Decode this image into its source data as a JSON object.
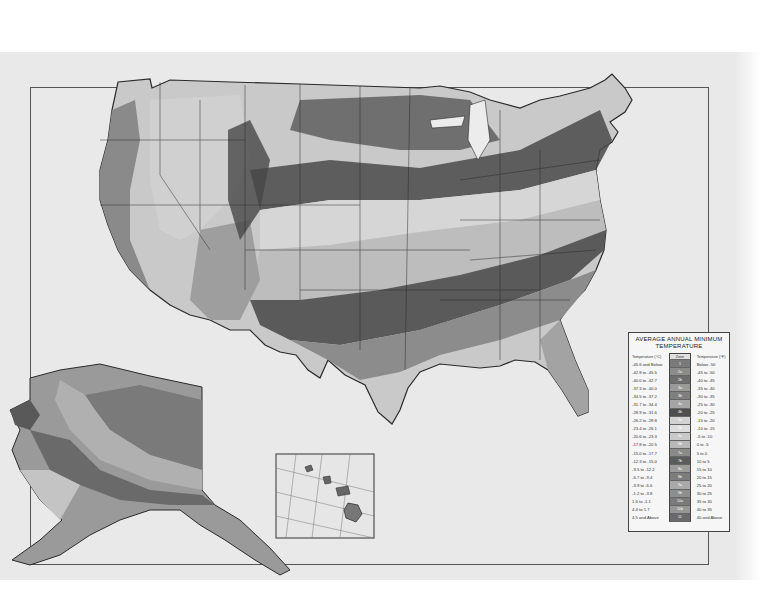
{
  "map": {
    "title": "Plant Hardiness Zone Map — Average Annual Minimum Temperature",
    "regions": [
      "contiguous-us",
      "alaska-inset",
      "hawaii-inset"
    ],
    "colors": {
      "paper": "#e9e9e9",
      "frame": "#555555",
      "outline": "#2a2a2a"
    }
  },
  "legend": {
    "title_line1": "AVERAGE ANNUAL MINIMUM",
    "title_line2": "TEMPERATURE",
    "header": {
      "celsius": "Temperature (°C)",
      "zone": "Zone",
      "fahrenheit": "Temperature (°F)"
    },
    "rows": [
      {
        "c": "-45.6 and Below",
        "zone": "1",
        "f": "Below -50",
        "color": "#7a7a7a"
      },
      {
        "c": "-42.8 to -45.5",
        "zone": "2a",
        "f": "-45 to -50",
        "color": "#8c8c8c"
      },
      {
        "c": "-40.0 to -42.7",
        "zone": "2b",
        "f": "-40 to -45",
        "color": "#6e6e6e"
      },
      {
        "c": "-37.3 to -40.0",
        "zone": "3a",
        "f": "-35 to -40",
        "color": "#9a9a9a"
      },
      {
        "c": "-34.5 to -37.2",
        "zone": "3b",
        "f": "-30 to -35",
        "color": "#7f7f7f"
      },
      {
        "c": "-31.7 to -34.4",
        "zone": "4a",
        "f": "-25 to -30",
        "color": "#a5a5a5"
      },
      {
        "c": "-28.9 to -31.6",
        "zone": "4b",
        "f": "-20 to -25",
        "color": "#4e4e4e"
      },
      {
        "c": "-26.2 to -28.8",
        "zone": "5a",
        "f": "-15 to -20",
        "color": "#d2d2d2"
      },
      {
        "c": "-23.4 to -26.1",
        "zone": "5b",
        "f": "-10 to -15",
        "color": "#dddddd"
      },
      {
        "c": "-20.6 to -23.3",
        "zone": "6a",
        "f": "-5 to -10",
        "color": "#c8c8c8"
      },
      {
        "c": "-17.8 to -20.5",
        "zone": "6b",
        "f": "0 to -5",
        "color": "#b8b8b8"
      },
      {
        "c": "-15.0 to -17.7",
        "zone": "7a",
        "f": "5 to 0",
        "color": "#8a8a8a"
      },
      {
        "c": "-12.3 to -15.0",
        "zone": "7b",
        "f": "10 to 5",
        "color": "#5c5c5c"
      },
      {
        "c": "-9.5 to -12.2",
        "zone": "8a",
        "f": "15 to 10",
        "color": "#9c9c9c"
      },
      {
        "c": "-6.7 to -9.4",
        "zone": "8b",
        "f": "20 to 15",
        "color": "#7c7c7c"
      },
      {
        "c": "-3.9 to -6.6",
        "zone": "9a",
        "f": "25 to 20",
        "color": "#a9a9a9"
      },
      {
        "c": "-1.2 to -3.8",
        "zone": "9b",
        "f": "30 to 25",
        "color": "#8e8e8e"
      },
      {
        "c": "1.6 to -1.1",
        "zone": "10a",
        "f": "35 to 30",
        "color": "#7a7a7a"
      },
      {
        "c": "4.4 to 1.7",
        "zone": "10b",
        "f": "40 to 35",
        "color": "#969696"
      },
      {
        "c": "4.5 and Above",
        "zone": "11",
        "f": "40 and Above",
        "color": "#6a6a6a"
      }
    ]
  }
}
